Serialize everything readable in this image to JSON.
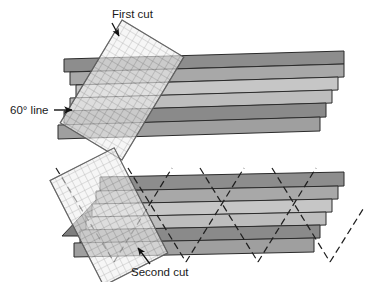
{
  "figure": {
    "type": "instructional-diagram",
    "background_color": "#ffffff"
  },
  "labels": {
    "first_cut": "First cut",
    "sixty_line": "60° line",
    "second_cut": "Second cut"
  },
  "colors": {
    "strip_dark": "#8d8d8d",
    "strip_light": "#c2c2c2",
    "strip_mid": "#a8a8a8",
    "edge_line": "#2b2b2b",
    "ruler_fill": "#f0f0f0",
    "ruler_grid": "#8a8a8a",
    "ruler_edge": "#6b6b6b",
    "cut_line": "#1f1f1f",
    "text": "#1a1a1a",
    "arrow": "#111111"
  },
  "panels": [
    {
      "name": "top-panel",
      "label": "First cut",
      "strip_count": 6,
      "ruler_rotation_deg": 30,
      "cut_marks": 0
    },
    {
      "name": "bottom-panel",
      "label": "Second cut",
      "strip_count": 6,
      "ruler_rotation_deg": -28,
      "cut_marks": 10
    }
  ],
  "top_panel": {
    "strips": [
      {
        "index": 0,
        "shade": "dark"
      },
      {
        "index": 1,
        "shade": "mid"
      },
      {
        "index": 2,
        "shade": "light"
      },
      {
        "index": 3,
        "shade": "light"
      },
      {
        "index": 4,
        "shade": "dark"
      },
      {
        "index": 5,
        "shade": "mid"
      }
    ]
  },
  "bottom_panel": {
    "strips": [
      {
        "index": 0,
        "shade": "dark"
      },
      {
        "index": 1,
        "shade": "mid"
      },
      {
        "index": 2,
        "shade": "light"
      },
      {
        "index": 3,
        "shade": "light"
      },
      {
        "index": 4,
        "shade": "dark"
      },
      {
        "index": 5,
        "shade": "mid"
      }
    ]
  }
}
